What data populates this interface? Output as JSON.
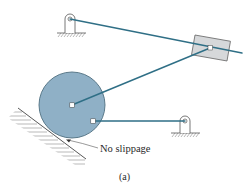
{
  "diagram": {
    "type": "planar linkage mechanism",
    "labels": {
      "contact_note": "No slippage",
      "caption": "(a)"
    },
    "colors": {
      "link": "#2f6f86",
      "disc_fill": "#8fb0c6",
      "disc_stroke": "#4f6f80",
      "slider_fill": "#d6d8da",
      "slider_stroke": "#6a6a6a",
      "ground": "#6d6d6d",
      "text": "#2a2a2a"
    },
    "components": [
      {
        "id": "ground-pivot-top-left",
        "kind": "pin support",
        "center": [
          70,
          19
        ]
      },
      {
        "id": "ground-pivot-right",
        "kind": "pin support",
        "center": [
          185,
          121
        ]
      },
      {
        "id": "slider-block",
        "kind": "slider",
        "center": [
          211,
          48
        ]
      },
      {
        "id": "rolling-disc",
        "kind": "disc",
        "center": [
          72,
          105
        ],
        "radius": 33
      },
      {
        "id": "inclined-ground",
        "kind": "inclined surface"
      }
    ]
  }
}
